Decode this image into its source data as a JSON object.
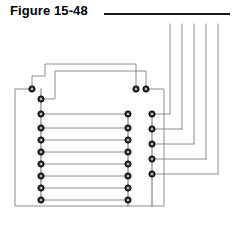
{
  "figure": {
    "title": "Figure 15-48",
    "rule": {
      "x": 104,
      "y": 13,
      "width": 126,
      "height": 2,
      "color": "#1a1a1a"
    }
  },
  "canvas": {
    "width": 237,
    "height": 225,
    "background": "#ffffff"
  },
  "style": {
    "wire_color": "#8c8c8c",
    "wire_color_dark": "#6e6e6e",
    "wire_width": 1,
    "node_fill": "#3a3a3a",
    "node_ring": "#000000",
    "node_radius": 3.1,
    "node_inner_radius": 1.1
  },
  "columns": {
    "left_outer_x": 15,
    "left_x": 41,
    "left_offset_x": 32,
    "middle_x": 128,
    "middle_pair_x": 136,
    "middle_pair2_x": 146,
    "right_x": 152,
    "bottom_y": 200,
    "top_pair_y": 89
  },
  "nodes": {
    "left_top_offset": {
      "x": 32,
      "y": 89
    },
    "left_column": [
      {
        "x": 41,
        "y": 99
      },
      {
        "x": 41,
        "y": 114
      },
      {
        "x": 41,
        "y": 128
      },
      {
        "x": 41,
        "y": 140
      },
      {
        "x": 41,
        "y": 152
      },
      {
        "x": 41,
        "y": 164
      },
      {
        "x": 41,
        "y": 176
      },
      {
        "x": 41,
        "y": 188
      },
      {
        "x": 41,
        "y": 200
      }
    ],
    "middle_pair": [
      {
        "x": 136,
        "y": 89
      },
      {
        "x": 146,
        "y": 89
      }
    ],
    "middle_column": [
      {
        "x": 128,
        "y": 114
      },
      {
        "x": 128,
        "y": 128
      },
      {
        "x": 128,
        "y": 140
      },
      {
        "x": 128,
        "y": 152
      },
      {
        "x": 128,
        "y": 164
      },
      {
        "x": 128,
        "y": 176
      },
      {
        "x": 128,
        "y": 188
      },
      {
        "x": 128,
        "y": 200
      }
    ],
    "right_column": [
      {
        "x": 152,
        "y": 114
      },
      {
        "x": 152,
        "y": 129
      },
      {
        "x": 152,
        "y": 144
      },
      {
        "x": 152,
        "y": 159
      },
      {
        "x": 152,
        "y": 174
      }
    ]
  },
  "rungs": [
    {
      "y": 114,
      "x1": 41,
      "x2": 128
    },
    {
      "y": 128,
      "x1": 41,
      "x2": 128
    },
    {
      "y": 140,
      "x1": 41,
      "x2": 128
    },
    {
      "y": 152,
      "x1": 41,
      "x2": 128
    },
    {
      "y": 164,
      "x1": 41,
      "x2": 128
    },
    {
      "y": 176,
      "x1": 41,
      "x2": 128
    },
    {
      "y": 188,
      "x1": 41,
      "x2": 128
    },
    {
      "y": 200,
      "x1": 41,
      "x2": 128
    }
  ],
  "top_vertical_lines": [
    {
      "x": 170,
      "y_top": 24
    },
    {
      "x": 182,
      "y_top": 24
    },
    {
      "x": 194,
      "y_top": 24
    },
    {
      "x": 206,
      "y_top": 24
    },
    {
      "x": 218,
      "y_top": 24
    }
  ],
  "right_routes": [
    {
      "node_y": 114,
      "to_x": 170
    },
    {
      "node_y": 129,
      "to_x": 182
    },
    {
      "node_y": 144,
      "to_x": 194
    },
    {
      "node_y": 159,
      "to_x": 206
    },
    {
      "node_y": 174,
      "to_x": 218
    }
  ],
  "stepped_wires": [
    {
      "name": "upper-step-wire-a",
      "from_node": "left_top_offset",
      "path": "M 32 89 L 32 76 L 45 76 L 45 64 L 136 64 L 136 89"
    },
    {
      "name": "upper-step-wire-b",
      "from_node": "left_column_0",
      "path": "M 41 99 L 55 99 L 55 71 L 146 71 L 146 89"
    }
  ],
  "outer_wire": {
    "name": "outer-loop-wire",
    "path": "M 32 89 L 15 89 L 15 206 L 164 206 L 164 89 L 146 89"
  },
  "middle_spine": {
    "x": 128,
    "y_top": 114,
    "y_bottom": 206
  },
  "right_spine": {
    "x": 152,
    "y_top": 114,
    "y_bottom": 206
  },
  "left_spine": {
    "x": 41,
    "y_top": 89,
    "y_bottom": 200
  }
}
